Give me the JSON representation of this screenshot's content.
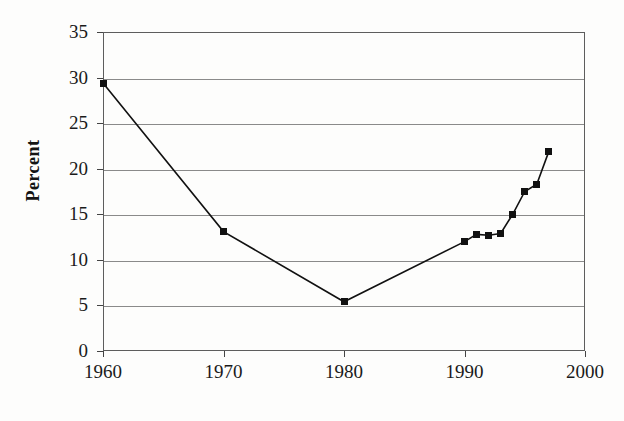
{
  "chart_data": {
    "type": "line",
    "title": "",
    "xlabel": "",
    "ylabel": "Percent",
    "xlim": [
      1960,
      2000
    ],
    "ylim": [
      0,
      35
    ],
    "ytick_labels": [
      "0",
      "5",
      "10",
      "15",
      "20",
      "25",
      "30",
      "35"
    ],
    "ytick_values": [
      0,
      5,
      10,
      15,
      20,
      25,
      30,
      35
    ],
    "xtick_labels": [
      "1960",
      "1970",
      "1980",
      "1990",
      "2000"
    ],
    "xtick_values": [
      1960,
      1970,
      1980,
      1990,
      2000
    ],
    "grid": "horizontal",
    "legend": "none",
    "marker": "filled-square",
    "line_color": "#111111",
    "grid_color": "#8a8a8a",
    "x": [
      1960,
      1970,
      1980,
      1990,
      1991,
      1992,
      1993,
      1994,
      1995,
      1996,
      1997
    ],
    "values": [
      29.4,
      13.1,
      5.4,
      12.0,
      12.8,
      12.7,
      12.9,
      15.0,
      17.5,
      18.3,
      21.9
    ],
    "series": [
      {
        "name": "Percent",
        "points": [
          {
            "x": 1960,
            "y": 29.4
          },
          {
            "x": 1970,
            "y": 13.1
          },
          {
            "x": 1980,
            "y": 5.4
          },
          {
            "x": 1990,
            "y": 12.0
          },
          {
            "x": 1991,
            "y": 12.8
          },
          {
            "x": 1992,
            "y": 12.7
          },
          {
            "x": 1993,
            "y": 12.9
          },
          {
            "x": 1994,
            "y": 15.0
          },
          {
            "x": 1995,
            "y": 17.5
          },
          {
            "x": 1996,
            "y": 18.3
          },
          {
            "x": 1997,
            "y": 21.9
          }
        ]
      }
    ]
  },
  "axes": {
    "y_title": "Percent",
    "y_ticks": [
      "35",
      "30",
      "25",
      "20",
      "15",
      "10",
      "5",
      "0"
    ],
    "x_ticks": [
      "1960",
      "1970",
      "1980",
      "1990",
      "2000"
    ]
  },
  "background_bleed": {
    "line1": "",
    "line2": "",
    "line3": "",
    "line4": ""
  }
}
